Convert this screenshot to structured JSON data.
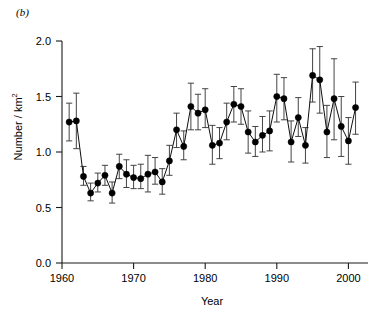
{
  "panel": {
    "label": "(b)"
  },
  "chart_data": {
    "type": "line",
    "title": "",
    "subtitle": "",
    "xlabel": "Year",
    "ylabel": "Number / km2",
    "ylabel_html": "Number / km<sup>2</sup>",
    "xlim": [
      1959.0,
      2002.5
    ],
    "ylim": [
      0.0,
      2.0
    ],
    "grid": false,
    "legend": null,
    "marker": "filled-circle",
    "errorbars": "vertical-with-caps",
    "xticks": [
      1960,
      1970,
      1980,
      1990,
      2000
    ],
    "xtick_labels": [
      "1960",
      "1970",
      "1980",
      "1990",
      "2000"
    ],
    "yticks": [
      0.0,
      0.5,
      1.0,
      1.5,
      2.0
    ],
    "ytick_labels": [
      "0.0",
      "0.5",
      "1.0",
      "1.5",
      "2.0"
    ],
    "series": [
      {
        "name": "Number / km2",
        "color": "#000000",
        "x": [
          1961,
          1962,
          1963,
          1964,
          1965,
          1966,
          1967,
          1968,
          1969,
          1970,
          1971,
          1972,
          1973,
          1974,
          1975,
          1976,
          1977,
          1978,
          1979,
          1980,
          1981,
          1982,
          1983,
          1984,
          1985,
          1986,
          1987,
          1988,
          1989,
          1990,
          1991,
          1992,
          1993,
          1994,
          1995,
          1996,
          1997,
          1998,
          1999,
          2000,
          2001
        ],
        "values": [
          1.27,
          1.28,
          0.78,
          0.63,
          0.72,
          0.79,
          0.63,
          0.87,
          0.8,
          0.77,
          0.76,
          0.8,
          0.82,
          0.73,
          0.92,
          1.2,
          1.05,
          1.41,
          1.35,
          1.38,
          1.06,
          1.08,
          1.27,
          1.43,
          1.41,
          1.18,
          1.09,
          1.15,
          1.19,
          1.5,
          1.48,
          1.09,
          1.31,
          1.06,
          1.69,
          1.65,
          1.18,
          1.48,
          1.23,
          1.1,
          1.4
        ],
        "err_low": [
          1.1,
          1.03,
          0.7,
          0.56,
          0.64,
          0.7,
          0.54,
          0.76,
          0.68,
          0.67,
          0.67,
          0.64,
          0.71,
          0.62,
          0.79,
          1.04,
          0.93,
          1.2,
          1.2,
          1.22,
          0.89,
          0.94,
          1.11,
          1.27,
          1.25,
          0.99,
          0.96,
          1.0,
          1.01,
          1.27,
          1.29,
          0.91,
          1.14,
          0.9,
          1.45,
          1.35,
          0.95,
          1.11,
          0.96,
          0.89,
          1.16
        ],
        "err_high": [
          1.44,
          1.53,
          0.87,
          0.72,
          0.81,
          0.88,
          0.73,
          0.98,
          0.93,
          0.88,
          0.89,
          0.97,
          0.95,
          0.85,
          1.06,
          1.35,
          1.19,
          1.62,
          1.52,
          1.57,
          1.24,
          1.22,
          1.44,
          1.59,
          1.57,
          1.37,
          1.23,
          1.32,
          1.37,
          1.7,
          1.67,
          1.28,
          1.49,
          1.22,
          1.93,
          1.95,
          1.42,
          1.84,
          1.5,
          1.31,
          1.63
        ]
      }
    ]
  }
}
